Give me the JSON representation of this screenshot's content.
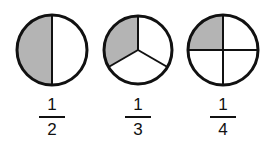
{
  "figure": {
    "fill_color": "#b4b4b4",
    "stroke_color": "#111111",
    "items": [
      {
        "shape": "circle-halves",
        "parts": 2,
        "shaded": 1,
        "numerator": "1",
        "denominator": "2"
      },
      {
        "shape": "circle-thirds",
        "parts": 3,
        "shaded": 1,
        "numerator": "1",
        "denominator": "3"
      },
      {
        "shape": "circle-quarters",
        "parts": 4,
        "shaded": 1,
        "numerator": "1",
        "denominator": "4"
      }
    ]
  }
}
